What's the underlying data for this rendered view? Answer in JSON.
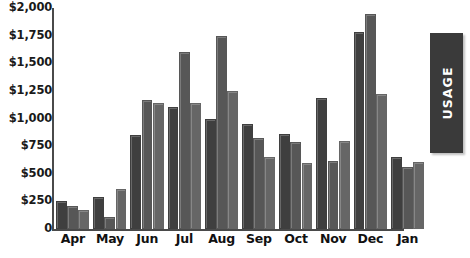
{
  "chart_data": {
    "type": "bar",
    "title": "",
    "xlabel": "",
    "ylabel": "",
    "categories": [
      "Apr",
      "May",
      "Jun",
      "Jul",
      "Aug",
      "Sep",
      "Oct",
      "Nov",
      "Dec",
      "Jan"
    ],
    "ylim": [
      0,
      2000
    ],
    "ytick_values": [
      0,
      250,
      500,
      750,
      1000,
      1250,
      1500,
      1750,
      2000
    ],
    "ytick_labels": [
      "0",
      "$250",
      "$500",
      "$750",
      "$1,000",
      "$1,250",
      "$1,500",
      "$1,750",
      "$2,000"
    ],
    "grid": false,
    "legend": "none",
    "series": [
      {
        "name": "series-1",
        "color": "#3f3f3f",
        "values": [
          250,
          290,
          850,
          1100,
          1000,
          950,
          860,
          1190,
          1780,
          650
        ]
      },
      {
        "name": "series-2",
        "color": "#575757",
        "values": [
          210,
          110,
          1170,
          1600,
          1750,
          820,
          790,
          620,
          1950,
          560
        ]
      },
      {
        "name": "series-3",
        "color": "#666666",
        "values": [
          175,
          360,
          1140,
          1140,
          1250,
          650,
          600,
          800,
          1220,
          610
        ]
      }
    ]
  },
  "side_tab": {
    "label": "USAGE",
    "color": "#3a3a3a"
  }
}
